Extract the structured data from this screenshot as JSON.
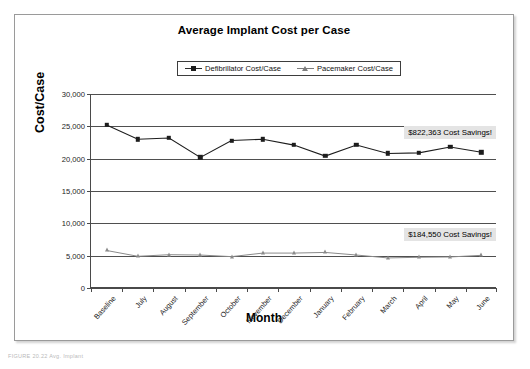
{
  "figure": {
    "caption_faint": "FIGURE 20.22   Avg. Implant"
  },
  "chart_data": {
    "type": "line",
    "title": "Average Implant Cost per Case",
    "xlabel": "Month",
    "ylabel": "Cost/Case",
    "categories": [
      "Baseline",
      "July",
      "August",
      "September",
      "October",
      "November",
      "December",
      "January",
      "February",
      "March",
      "April",
      "May",
      "June"
    ],
    "ylim": [
      0,
      30000
    ],
    "ytick_values": [
      0,
      5000,
      10000,
      15000,
      20000,
      25000,
      30000
    ],
    "ytick_labels": [
      "0",
      "5,000",
      "10,000",
      "15,000",
      "20,000",
      "25,000",
      "30,000"
    ],
    "grid": true,
    "legend_position": "top-center",
    "series": [
      {
        "name": "Defibrillator Cost/Case",
        "marker": "square",
        "color": "#1d1d1d",
        "values": [
          25200,
          23000,
          23200,
          20200,
          22800,
          23000,
          22100,
          20400,
          22100,
          20800,
          20900,
          21800,
          21000
        ]
      },
      {
        "name": "Pacemaker Cost/Case",
        "marker": "triangle",
        "color": "#8a8a8a",
        "values": [
          5800,
          4900,
          5150,
          5100,
          4850,
          5400,
          5400,
          5500,
          5100,
          4650,
          4750,
          4800,
          5050
        ]
      }
    ],
    "annotations": [
      {
        "text": "$822,363 Cost Savings!",
        "value": 24000,
        "category_index": 11
      },
      {
        "text": "$184,550 Cost Savings!",
        "value": 8200,
        "category_index": 11
      }
    ]
  }
}
